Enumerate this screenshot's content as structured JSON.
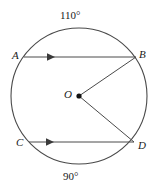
{
  "figure": {
    "name": "circle-with-parallel-chords",
    "stroke_color": "#4a4a4a",
    "text_color": "#1a1a1a",
    "background_color": "#ffffff"
  },
  "circle": {
    "center_label": "O",
    "center_x": 79,
    "center_y": 96,
    "radius": 68
  },
  "points": {
    "a": {
      "label": "A",
      "x": 24,
      "y": 57
    },
    "b": {
      "label": "B",
      "x": 136,
      "y": 57
    },
    "c": {
      "label": "C",
      "x": 29,
      "y": 142
    },
    "d": {
      "label": "D",
      "x": 134,
      "y": 142
    },
    "o": {
      "label": "O",
      "x": 79,
      "y": 96
    }
  },
  "arcs": {
    "top": {
      "label": "110°",
      "value": 110,
      "endpoints": "A to B"
    },
    "bottom": {
      "label": "90°",
      "value": 90,
      "endpoints": "C to D"
    }
  },
  "chords": {
    "ab": {
      "label": "AB",
      "from": "A",
      "to": "B",
      "arrow_direction": "right",
      "parallel_mark": true
    },
    "cd": {
      "label": "CD",
      "from": "C",
      "to": "D",
      "arrow_direction": "right",
      "parallel_mark": true
    }
  },
  "radii": {
    "ob": {
      "label": "OB",
      "from": "O",
      "to": "B"
    },
    "od": {
      "label": "OD",
      "from": "O",
      "to": "D"
    }
  }
}
